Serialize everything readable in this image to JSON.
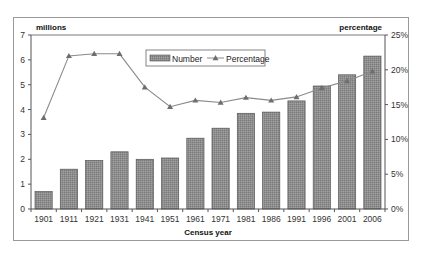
{
  "chart_data": {
    "type": "bar",
    "combo": "bar+line",
    "title": "",
    "xlabel": "Census year",
    "ylabel": "millions",
    "ylabel_right": "percentage",
    "categories": [
      "1901",
      "1911",
      "1921",
      "1931",
      "1941",
      "1951",
      "1961",
      "1971",
      "1981",
      "1986",
      "1991",
      "1996",
      "2001",
      "2006"
    ],
    "series": [
      {
        "name": "Number",
        "type": "bar",
        "axis": "left",
        "unit": "millions",
        "values": [
          0.7,
          1.6,
          1.95,
          2.3,
          2.0,
          2.05,
          2.85,
          3.25,
          3.85,
          3.9,
          4.35,
          4.95,
          5.4,
          6.15
        ]
      },
      {
        "name": "Percentage",
        "type": "line",
        "axis": "right",
        "unit": "%",
        "marker": "triangle",
        "values": [
          13.1,
          22.0,
          22.3,
          22.3,
          17.5,
          14.7,
          15.6,
          15.3,
          16.0,
          15.6,
          16.1,
          17.4,
          18.4,
          19.8
        ]
      }
    ],
    "ylim": [
      0,
      7
    ],
    "ylim_right": [
      0,
      25
    ],
    "yticks": [
      "0",
      "1",
      "2",
      "3",
      "4",
      "5",
      "6",
      "7"
    ],
    "yticks_right": [
      "0%",
      "5%",
      "10%",
      "15%",
      "20%",
      "25%"
    ],
    "grid": false,
    "legend_position": "top-center-inside",
    "colors": {
      "bar_fill": "#8c8c8c",
      "bar_stroke": "#555555",
      "line": "#8a8a8a",
      "marker": "#6e6e6e",
      "axis": "#555555",
      "frame": "#9a9a9a"
    }
  },
  "legend": {
    "number_label": "Number",
    "percentage_label": "Percentage"
  },
  "axes": {
    "left_title": "millions",
    "right_title": "percentage",
    "x_title": "Census year"
  }
}
